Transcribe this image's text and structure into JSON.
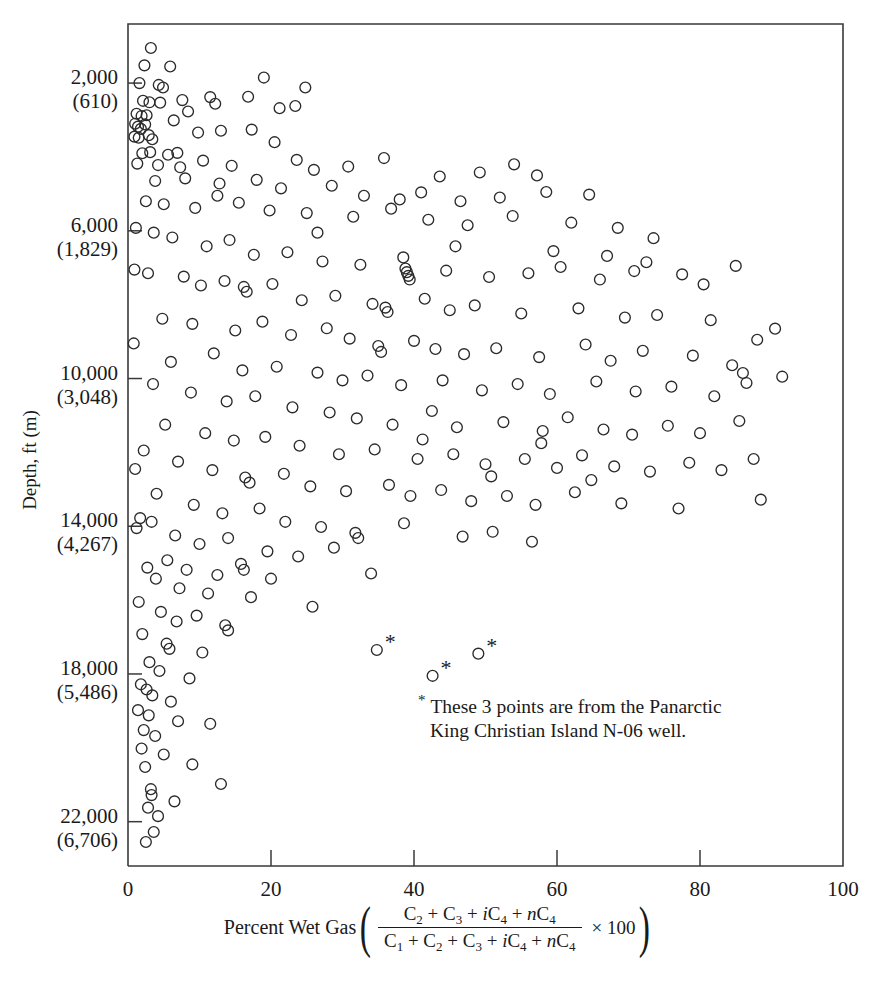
{
  "chart_data": {
    "type": "scatter",
    "title": "",
    "xlabel": "Percent Wet Gas ((C2 + C3 + iC4 + nC4) / (C1 + C2 + C3 + iC4 + nC4) X 100)",
    "ylabel": "Depth, ft (m)",
    "xlim": [
      0,
      100
    ],
    "ylim": [
      23200,
      400
    ],
    "y_axis_inverted": true,
    "grid": false,
    "legend": null,
    "xticks": [
      0,
      20,
      40,
      60,
      80,
      100
    ],
    "xtick_labels": [
      "0",
      "20",
      "40",
      "60",
      "80",
      "100"
    ],
    "yticks": [
      2000,
      6000,
      10000,
      14000,
      18000,
      22000
    ],
    "ytick_labels": [
      [
        "2,000",
        "(610)"
      ],
      [
        "6,000",
        "(1,829)"
      ],
      [
        "10,000",
        "(3,048)"
      ],
      [
        "14,000",
        "(4,267)"
      ],
      [
        "18,000",
        "(5,486)"
      ],
      [
        "22,000",
        "(6,706)"
      ]
    ],
    "marker": "open-circle",
    "marker_color": "#2b2b2b",
    "annotation": {
      "symbol": "*",
      "line1": "These 3 points are from the Panarctic",
      "line2": "King Christian Island N-06 well.",
      "x": 35,
      "y": 19200
    },
    "starred_points": [
      {
        "x": 34.8,
        "y": 17350
      },
      {
        "x": 42.6,
        "y": 18050
      },
      {
        "x": 49.0,
        "y": 17450
      }
    ],
    "points": [
      {
        "x": 3.2,
        "y": 1050
      },
      {
        "x": 2.3,
        "y": 1520
      },
      {
        "x": 5.9,
        "y": 1550
      },
      {
        "x": 1.6,
        "y": 2000
      },
      {
        "x": 4.3,
        "y": 2050
      },
      {
        "x": 4.9,
        "y": 2120
      },
      {
        "x": 19.0,
        "y": 1850
      },
      {
        "x": 24.8,
        "y": 2120
      },
      {
        "x": 2.1,
        "y": 2480
      },
      {
        "x": 3.0,
        "y": 2520
      },
      {
        "x": 4.5,
        "y": 2530
      },
      {
        "x": 7.6,
        "y": 2460
      },
      {
        "x": 1.2,
        "y": 2830
      },
      {
        "x": 1.9,
        "y": 2890
      },
      {
        "x": 2.6,
        "y": 2870
      },
      {
        "x": 1.0,
        "y": 3100
      },
      {
        "x": 1.4,
        "y": 3180
      },
      {
        "x": 1.8,
        "y": 3240
      },
      {
        "x": 2.4,
        "y": 3120
      },
      {
        "x": 0.9,
        "y": 3450
      },
      {
        "x": 1.5,
        "y": 3480
      },
      {
        "x": 2.9,
        "y": 3410
      },
      {
        "x": 3.4,
        "y": 3520
      },
      {
        "x": 6.4,
        "y": 3010
      },
      {
        "x": 8.4,
        "y": 2770
      },
      {
        "x": 11.5,
        "y": 2380
      },
      {
        "x": 12.2,
        "y": 2560
      },
      {
        "x": 16.8,
        "y": 2370
      },
      {
        "x": 21.2,
        "y": 2680
      },
      {
        "x": 23.4,
        "y": 2620
      },
      {
        "x": 9.8,
        "y": 3340
      },
      {
        "x": 13.0,
        "y": 3290
      },
      {
        "x": 17.3,
        "y": 3260
      },
      {
        "x": 20.5,
        "y": 3600
      },
      {
        "x": 2.0,
        "y": 3900
      },
      {
        "x": 3.1,
        "y": 3870
      },
      {
        "x": 5.6,
        "y": 3940
      },
      {
        "x": 6.9,
        "y": 3890
      },
      {
        "x": 1.3,
        "y": 4180
      },
      {
        "x": 4.2,
        "y": 4220
      },
      {
        "x": 7.3,
        "y": 4280
      },
      {
        "x": 10.5,
        "y": 4100
      },
      {
        "x": 14.5,
        "y": 4240
      },
      {
        "x": 23.6,
        "y": 4080
      },
      {
        "x": 26.0,
        "y": 4350
      },
      {
        "x": 30.8,
        "y": 4260
      },
      {
        "x": 35.8,
        "y": 4030
      },
      {
        "x": 43.6,
        "y": 4530
      },
      {
        "x": 49.2,
        "y": 4420
      },
      {
        "x": 54.0,
        "y": 4200
      },
      {
        "x": 57.2,
        "y": 4500
      },
      {
        "x": 3.8,
        "y": 4650
      },
      {
        "x": 8.0,
        "y": 4580
      },
      {
        "x": 12.8,
        "y": 4720
      },
      {
        "x": 18.0,
        "y": 4620
      },
      {
        "x": 21.4,
        "y": 4850
      },
      {
        "x": 28.5,
        "y": 4780
      },
      {
        "x": 33.0,
        "y": 5050
      },
      {
        "x": 38.0,
        "y": 5150
      },
      {
        "x": 41.0,
        "y": 4960
      },
      {
        "x": 46.5,
        "y": 5200
      },
      {
        "x": 52.0,
        "y": 5100
      },
      {
        "x": 58.5,
        "y": 4950
      },
      {
        "x": 64.5,
        "y": 5020
      },
      {
        "x": 2.5,
        "y": 5200
      },
      {
        "x": 5.0,
        "y": 5280
      },
      {
        "x": 9.4,
        "y": 5380
      },
      {
        "x": 15.5,
        "y": 5240
      },
      {
        "x": 19.8,
        "y": 5450
      },
      {
        "x": 25.0,
        "y": 5520
      },
      {
        "x": 31.5,
        "y": 5620
      },
      {
        "x": 36.8,
        "y": 5400
      },
      {
        "x": 42.0,
        "y": 5700
      },
      {
        "x": 47.5,
        "y": 5850
      },
      {
        "x": 53.8,
        "y": 5600
      },
      {
        "x": 62.0,
        "y": 5780
      },
      {
        "x": 68.5,
        "y": 5920
      },
      {
        "x": 73.5,
        "y": 6200
      },
      {
        "x": 1.1,
        "y": 5920
      },
      {
        "x": 3.6,
        "y": 6050
      },
      {
        "x": 6.2,
        "y": 6180
      },
      {
        "x": 11.0,
        "y": 6420
      },
      {
        "x": 14.2,
        "y": 6250
      },
      {
        "x": 17.6,
        "y": 6650
      },
      {
        "x": 22.3,
        "y": 6580
      },
      {
        "x": 27.2,
        "y": 6830
      },
      {
        "x": 32.5,
        "y": 6920
      },
      {
        "x": 38.5,
        "y": 6720
      },
      {
        "x": 38.8,
        "y": 7020
      },
      {
        "x": 39.0,
        "y": 7120
      },
      {
        "x": 39.2,
        "y": 7220
      },
      {
        "x": 39.4,
        "y": 7320
      },
      {
        "x": 44.5,
        "y": 7080
      },
      {
        "x": 50.5,
        "y": 7250
      },
      {
        "x": 56.0,
        "y": 7150
      },
      {
        "x": 60.5,
        "y": 6980
      },
      {
        "x": 66.0,
        "y": 7320
      },
      {
        "x": 70.8,
        "y": 7090
      },
      {
        "x": 77.5,
        "y": 7180
      },
      {
        "x": 85.0,
        "y": 6950
      },
      {
        "x": 2.8,
        "y": 7150
      },
      {
        "x": 7.8,
        "y": 7240
      },
      {
        "x": 10.2,
        "y": 7480
      },
      {
        "x": 13.5,
        "y": 7360
      },
      {
        "x": 16.2,
        "y": 7520
      },
      {
        "x": 16.6,
        "y": 7650
      },
      {
        "x": 20.2,
        "y": 7440
      },
      {
        "x": 24.3,
        "y": 7880
      },
      {
        "x": 29.0,
        "y": 7760
      },
      {
        "x": 34.2,
        "y": 7980
      },
      {
        "x": 36.0,
        "y": 8080
      },
      {
        "x": 36.3,
        "y": 8200
      },
      {
        "x": 41.5,
        "y": 7840
      },
      {
        "x": 45.0,
        "y": 8150
      },
      {
        "x": 48.5,
        "y": 8020
      },
      {
        "x": 55.0,
        "y": 8240
      },
      {
        "x": 63.0,
        "y": 8100
      },
      {
        "x": 69.5,
        "y": 8350
      },
      {
        "x": 74.0,
        "y": 8280
      },
      {
        "x": 81.5,
        "y": 8420
      },
      {
        "x": 90.5,
        "y": 8650
      },
      {
        "x": 4.8,
        "y": 8380
      },
      {
        "x": 9.0,
        "y": 8520
      },
      {
        "x": 15.0,
        "y": 8700
      },
      {
        "x": 18.8,
        "y": 8460
      },
      {
        "x": 22.8,
        "y": 8820
      },
      {
        "x": 27.8,
        "y": 8640
      },
      {
        "x": 31.0,
        "y": 8920
      },
      {
        "x": 35.0,
        "y": 9120
      },
      {
        "x": 35.4,
        "y": 9280
      },
      {
        "x": 40.0,
        "y": 8980
      },
      {
        "x": 43.0,
        "y": 9200
      },
      {
        "x": 47.0,
        "y": 9340
      },
      {
        "x": 51.5,
        "y": 9180
      },
      {
        "x": 57.5,
        "y": 9420
      },
      {
        "x": 64.0,
        "y": 9080
      },
      {
        "x": 67.5,
        "y": 9520
      },
      {
        "x": 72.0,
        "y": 9250
      },
      {
        "x": 79.0,
        "y": 9380
      },
      {
        "x": 84.5,
        "y": 9640
      },
      {
        "x": 6.0,
        "y": 9550
      },
      {
        "x": 12.0,
        "y": 9320
      },
      {
        "x": 16.0,
        "y": 9780
      },
      {
        "x": 20.8,
        "y": 9680
      },
      {
        "x": 26.5,
        "y": 9840
      },
      {
        "x": 30.0,
        "y": 10050
      },
      {
        "x": 33.5,
        "y": 9920
      },
      {
        "x": 38.2,
        "y": 10180
      },
      {
        "x": 44.0,
        "y": 10050
      },
      {
        "x": 49.5,
        "y": 10320
      },
      {
        "x": 54.5,
        "y": 10150
      },
      {
        "x": 59.0,
        "y": 10420
      },
      {
        "x": 65.5,
        "y": 10080
      },
      {
        "x": 71.0,
        "y": 10350
      },
      {
        "x": 76.0,
        "y": 10220
      },
      {
        "x": 82.0,
        "y": 10480
      },
      {
        "x": 86.5,
        "y": 10120
      },
      {
        "x": 3.5,
        "y": 10150
      },
      {
        "x": 8.8,
        "y": 10380
      },
      {
        "x": 13.8,
        "y": 10620
      },
      {
        "x": 17.8,
        "y": 10480
      },
      {
        "x": 23.0,
        "y": 10780
      },
      {
        "x": 28.2,
        "y": 10920
      },
      {
        "x": 32.0,
        "y": 11080
      },
      {
        "x": 37.0,
        "y": 11250
      },
      {
        "x": 42.5,
        "y": 10880
      },
      {
        "x": 46.0,
        "y": 11320
      },
      {
        "x": 52.5,
        "y": 11180
      },
      {
        "x": 58.0,
        "y": 11420
      },
      {
        "x": 61.5,
        "y": 11050
      },
      {
        "x": 66.5,
        "y": 11380
      },
      {
        "x": 70.5,
        "y": 11520
      },
      {
        "x": 75.5,
        "y": 11280
      },
      {
        "x": 80.0,
        "y": 11480
      },
      {
        "x": 85.5,
        "y": 11150
      },
      {
        "x": 5.2,
        "y": 11250
      },
      {
        "x": 10.8,
        "y": 11480
      },
      {
        "x": 14.8,
        "y": 11680
      },
      {
        "x": 19.2,
        "y": 11580
      },
      {
        "x": 24.0,
        "y": 11820
      },
      {
        "x": 29.5,
        "y": 12050
      },
      {
        "x": 34.5,
        "y": 11920
      },
      {
        "x": 40.5,
        "y": 12180
      },
      {
        "x": 45.5,
        "y": 12050
      },
      {
        "x": 50.0,
        "y": 12320
      },
      {
        "x": 55.5,
        "y": 12180
      },
      {
        "x": 60.0,
        "y": 12420
      },
      {
        "x": 63.5,
        "y": 12080
      },
      {
        "x": 68.0,
        "y": 12380
      },
      {
        "x": 73.0,
        "y": 12520
      },
      {
        "x": 78.5,
        "y": 12280
      },
      {
        "x": 83.0,
        "y": 12480
      },
      {
        "x": 87.5,
        "y": 12180
      },
      {
        "x": 2.2,
        "y": 11950
      },
      {
        "x": 7.0,
        "y": 12250
      },
      {
        "x": 11.8,
        "y": 12480
      },
      {
        "x": 16.4,
        "y": 12680
      },
      {
        "x": 17.0,
        "y": 12820
      },
      {
        "x": 21.8,
        "y": 12580
      },
      {
        "x": 25.5,
        "y": 12920
      },
      {
        "x": 30.5,
        "y": 13050
      },
      {
        "x": 36.5,
        "y": 12880
      },
      {
        "x": 39.5,
        "y": 13180
      },
      {
        "x": 43.8,
        "y": 13020
      },
      {
        "x": 48.0,
        "y": 13320
      },
      {
        "x": 53.0,
        "y": 13180
      },
      {
        "x": 57.0,
        "y": 13420
      },
      {
        "x": 62.5,
        "y": 13080
      },
      {
        "x": 69.0,
        "y": 13380
      },
      {
        "x": 77.0,
        "y": 13520
      },
      {
        "x": 88.5,
        "y": 13280
      },
      {
        "x": 4.0,
        "y": 13120
      },
      {
        "x": 9.2,
        "y": 13420
      },
      {
        "x": 13.2,
        "y": 13650
      },
      {
        "x": 18.4,
        "y": 13520
      },
      {
        "x": 22.0,
        "y": 13880
      },
      {
        "x": 27.0,
        "y": 14020
      },
      {
        "x": 31.8,
        "y": 14180
      },
      {
        "x": 32.2,
        "y": 14320
      },
      {
        "x": 38.6,
        "y": 13920
      },
      {
        "x": 46.8,
        "y": 14280
      },
      {
        "x": 51.0,
        "y": 14150
      },
      {
        "x": 56.5,
        "y": 14420
      },
      {
        "x": 1.7,
        "y": 13780
      },
      {
        "x": 3.3,
        "y": 13880
      },
      {
        "x": 6.6,
        "y": 14250
      },
      {
        "x": 10.0,
        "y": 14480
      },
      {
        "x": 14.0,
        "y": 14320
      },
      {
        "x": 19.5,
        "y": 14680
      },
      {
        "x": 23.8,
        "y": 14820
      },
      {
        "x": 28.8,
        "y": 14580
      },
      {
        "x": 5.5,
        "y": 14920
      },
      {
        "x": 8.2,
        "y": 15180
      },
      {
        "x": 12.5,
        "y": 15320
      },
      {
        "x": 15.8,
        "y": 15020
      },
      {
        "x": 16.2,
        "y": 15180
      },
      {
        "x": 20.0,
        "y": 15420
      },
      {
        "x": 34.0,
        "y": 15280
      },
      {
        "x": 2.7,
        "y": 15120
      },
      {
        "x": 3.9,
        "y": 15420
      },
      {
        "x": 7.2,
        "y": 15680
      },
      {
        "x": 11.2,
        "y": 15820
      },
      {
        "x": 17.2,
        "y": 15920
      },
      {
        "x": 25.8,
        "y": 16180
      },
      {
        "x": 1.5,
        "y": 16050
      },
      {
        "x": 4.6,
        "y": 16320
      },
      {
        "x": 6.8,
        "y": 16580
      },
      {
        "x": 9.6,
        "y": 16420
      },
      {
        "x": 13.6,
        "y": 16680
      },
      {
        "x": 14.0,
        "y": 16820
      },
      {
        "x": 2.0,
        "y": 16920
      },
      {
        "x": 5.4,
        "y": 17180
      },
      {
        "x": 5.8,
        "y": 17320
      },
      {
        "x": 10.4,
        "y": 17420
      },
      {
        "x": 3.0,
        "y": 17680
      },
      {
        "x": 4.4,
        "y": 17920
      },
      {
        "x": 8.6,
        "y": 18120
      },
      {
        "x": 1.8,
        "y": 18280
      },
      {
        "x": 2.6,
        "y": 18420
      },
      {
        "x": 3.4,
        "y": 18580
      },
      {
        "x": 6.0,
        "y": 18750
      },
      {
        "x": 1.4,
        "y": 18980
      },
      {
        "x": 2.9,
        "y": 19120
      },
      {
        "x": 7.0,
        "y": 19280
      },
      {
        "x": 2.2,
        "y": 19520
      },
      {
        "x": 3.8,
        "y": 19680
      },
      {
        "x": 11.5,
        "y": 19350
      },
      {
        "x": 1.9,
        "y": 20020
      },
      {
        "x": 5.0,
        "y": 20180
      },
      {
        "x": 2.4,
        "y": 20520
      },
      {
        "x": 9.0,
        "y": 20450
      },
      {
        "x": 3.2,
        "y": 21120
      },
      {
        "x": 3.3,
        "y": 21280
      },
      {
        "x": 2.8,
        "y": 21620
      },
      {
        "x": 4.2,
        "y": 21850
      },
      {
        "x": 3.6,
        "y": 22280
      },
      {
        "x": 6.5,
        "y": 21450
      },
      {
        "x": 13.0,
        "y": 20980
      },
      {
        "x": 2.5,
        "y": 22550
      },
      {
        "x": 0.8,
        "y": 9050
      },
      {
        "x": 1.0,
        "y": 12450
      },
      {
        "x": 1.2,
        "y": 14050
      },
      {
        "x": 0.9,
        "y": 7050
      },
      {
        "x": 12.5,
        "y": 5050
      },
      {
        "x": 26.5,
        "y": 6050
      },
      {
        "x": 45.8,
        "y": 6420
      },
      {
        "x": 59.5,
        "y": 6550
      },
      {
        "x": 67.0,
        "y": 6680
      },
      {
        "x": 80.5,
        "y": 7450
      },
      {
        "x": 88.0,
        "y": 8950
      },
      {
        "x": 91.5,
        "y": 9950
      },
      {
        "x": 86.0,
        "y": 9850
      },
      {
        "x": 72.5,
        "y": 6850
      },
      {
        "x": 57.8,
        "y": 11750
      },
      {
        "x": 64.8,
        "y": 12750
      },
      {
        "x": 50.8,
        "y": 12650
      },
      {
        "x": 41.2,
        "y": 11650
      }
    ]
  },
  "axis_labels": {
    "y_title": "Depth, ft (m)",
    "x_title_prefix": "Percent Wet Gas",
    "x_numerator": "C2 + C3 + iC4 + nC4",
    "x_denominator": "C1 + C2 + C3 + iC4 + nC4",
    "x_multiplier": "× 100"
  },
  "note": {
    "symbol": "*",
    "line1": "These 3 points are from the Panarctic",
    "line2": "King Christian Island N-06 well."
  }
}
